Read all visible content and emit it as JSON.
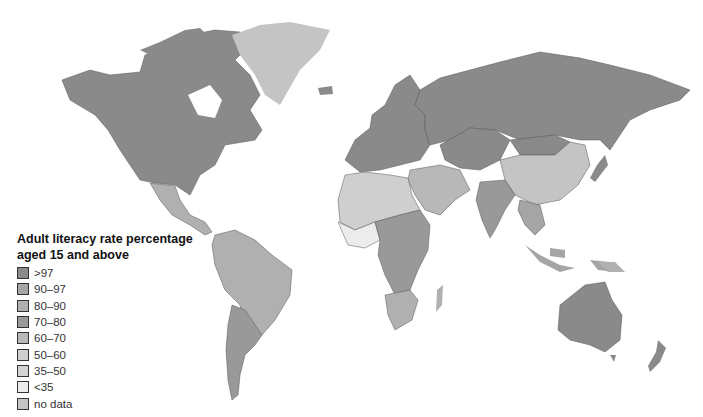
{
  "legend": {
    "title_line1": "Adult literacy rate percentage",
    "title_line2": "aged 15 and above",
    "items": [
      {
        "label": ">97",
        "color": "#8a8a8a"
      },
      {
        "label": "90–97",
        "color": "#a5a5a5"
      },
      {
        "label": "80–90",
        "color": "#b0b0b0"
      },
      {
        "label": "70–80",
        "color": "#999999"
      },
      {
        "label": "60–70",
        "color": "#b8b8b8"
      },
      {
        "label": "50–60",
        "color": "#cfcfcf"
      },
      {
        "label": "35–50",
        "color": "#d4d4d4"
      },
      {
        "label": "<35",
        "color": "#ececec"
      },
      {
        "label": "no data",
        "color": "#c4c4c4"
      }
    ]
  },
  "colors": {
    "gt97": "#8a8a8a",
    "c90_97": "#a5a5a5",
    "c80_90": "#b0b0b0",
    "c70_80": "#999999",
    "c60_70": "#b8b8b8",
    "c50_60": "#cfcfcf",
    "c35_50": "#d4d4d4",
    "lt35": "#ececec",
    "nodata": "#c4c4c4",
    "border": "#555555"
  }
}
